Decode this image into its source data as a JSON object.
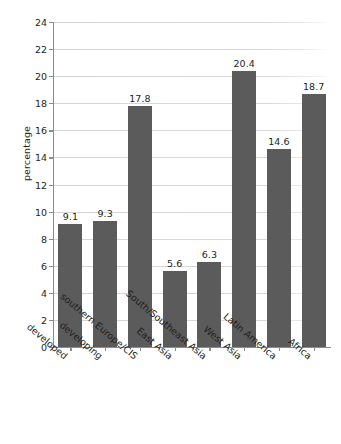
{
  "chart_data": {
    "type": "bar",
    "title": "",
    "subtitle": "",
    "xlabel": "",
    "ylabel": "percentage",
    "ylim": [
      0,
      24
    ],
    "ytick_step": 2,
    "yticks": [
      0,
      2,
      4,
      6,
      8,
      10,
      12,
      14,
      16,
      18,
      20,
      22,
      24
    ],
    "ytick_labels": [
      "0",
      "2",
      "4",
      "6",
      "8",
      "10",
      "12",
      "14",
      "16",
      "18",
      "20",
      "22",
      "24"
    ],
    "grid": true,
    "grid_axis": "y",
    "legend": false,
    "legend_position": "none",
    "bar_color": "#5b5b5b",
    "axis_color": "#8c8c8c",
    "grid_color": "#d4d4d4",
    "text_color": "#231f20",
    "value_labels": true,
    "xtick_rotation": -40,
    "categories": [
      "developed",
      "developing",
      "southern Europe/CIS",
      "East Asia",
      "South/Southeast Asia",
      "West Asia",
      "Latin America",
      "Africa"
    ],
    "values": [
      9.1,
      9.3,
      17.8,
      5.6,
      6.3,
      20.4,
      14.6,
      18.7
    ],
    "value_label_texts": [
      "9.1",
      "9.3",
      "17.8",
      "5.6",
      "6.3",
      "20.4",
      "14.6",
      "18.7"
    ]
  }
}
